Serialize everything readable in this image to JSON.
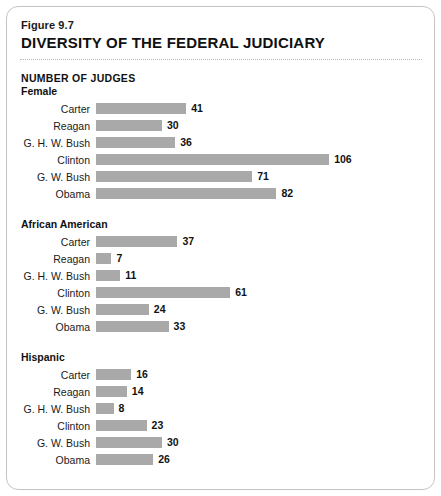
{
  "figure": {
    "number": "Figure 9.7",
    "title": "DIVERSITY OF THE FEDERAL JUDICIARY",
    "chart_heading": "NUMBER OF JUDGES"
  },
  "colors": {
    "bar": "#a9a9a9",
    "border": "#c3c3c3",
    "text": "#111111",
    "background": "#ffffff"
  },
  "chart_data": {
    "type": "bar",
    "orientation": "horizontal",
    "title": "DIVERSITY OF THE FEDERAL JUDICIARY",
    "subtitle": "Figure 9.7",
    "xlabel": "NUMBER OF JUDGES",
    "ylabel": "",
    "xlim": [
      0,
      106
    ],
    "grid": false,
    "legend": false,
    "categories": [
      "Carter",
      "Reagan",
      "G. H. W. Bush",
      "Clinton",
      "G. W. Bush",
      "Obama"
    ],
    "series": [
      {
        "name": "Female",
        "values": [
          41,
          30,
          36,
          106,
          71,
          82
        ]
      },
      {
        "name": "African American",
        "values": [
          37,
          7,
          11,
          61,
          24,
          33
        ]
      },
      {
        "name": "Hispanic",
        "values": [
          16,
          14,
          8,
          23,
          30,
          26
        ]
      }
    ],
    "groups": [
      {
        "label": "Female",
        "rows": [
          {
            "label": "Carter",
            "value": 41
          },
          {
            "label": "Reagan",
            "value": 30
          },
          {
            "label": "G. H. W. Bush",
            "value": 36
          },
          {
            "label": "Clinton",
            "value": 106
          },
          {
            "label": "G. W. Bush",
            "value": 71
          },
          {
            "label": "Obama",
            "value": 82
          }
        ]
      },
      {
        "label": "African American",
        "rows": [
          {
            "label": "Carter",
            "value": 37
          },
          {
            "label": "Reagan",
            "value": 7
          },
          {
            "label": "G. H. W. Bush",
            "value": 11
          },
          {
            "label": "Clinton",
            "value": 61
          },
          {
            "label": "G. W. Bush",
            "value": 24
          },
          {
            "label": "Obama",
            "value": 33
          }
        ]
      },
      {
        "label": "Hispanic",
        "rows": [
          {
            "label": "Carter",
            "value": 16
          },
          {
            "label": "Reagan",
            "value": 14
          },
          {
            "label": "G. H. W. Bush",
            "value": 8
          },
          {
            "label": "Clinton",
            "value": 23
          },
          {
            "label": "G. W. Bush",
            "value": 30
          },
          {
            "label": "Obama",
            "value": 26
          }
        ]
      }
    ]
  }
}
